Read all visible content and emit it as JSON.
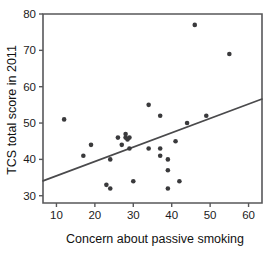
{
  "chart_data": {
    "type": "scatter",
    "title": "",
    "xlabel": "Concern about passive smoking",
    "ylabel": "TCS total score in 2011",
    "xlim": [
      6.5,
      63.5
    ],
    "ylim": [
      28.0,
      80.0
    ],
    "xticks": [
      10,
      20,
      30,
      40,
      50,
      60
    ],
    "yticks": [
      30,
      40,
      50,
      60,
      70,
      80
    ],
    "xtick_labels": [
      "10",
      "20",
      "30",
      "40",
      "50",
      "60"
    ],
    "ytick_labels": [
      "30",
      "40",
      "50",
      "60",
      "70",
      "80"
    ],
    "grid": false,
    "legend": false,
    "point_color": "#3a3a3c",
    "line_color": "#4a4a4c",
    "axis_color": "#58585a",
    "points": [
      {
        "x": 12,
        "y": 51
      },
      {
        "x": 17,
        "y": 41
      },
      {
        "x": 19,
        "y": 44
      },
      {
        "x": 23,
        "y": 33
      },
      {
        "x": 24,
        "y": 40
      },
      {
        "x": 24,
        "y": 32
      },
      {
        "x": 26,
        "y": 46
      },
      {
        "x": 27,
        "y": 44
      },
      {
        "x": 28,
        "y": 46
      },
      {
        "x": 28,
        "y": 47
      },
      {
        "x": 28.5,
        "y": 45.5
      },
      {
        "x": 29,
        "y": 46
      },
      {
        "x": 29,
        "y": 43
      },
      {
        "x": 30,
        "y": 34
      },
      {
        "x": 34,
        "y": 55
      },
      {
        "x": 34,
        "y": 43
      },
      {
        "x": 37,
        "y": 52
      },
      {
        "x": 37,
        "y": 43
      },
      {
        "x": 37,
        "y": 41
      },
      {
        "x": 39,
        "y": 40
      },
      {
        "x": 39,
        "y": 37
      },
      {
        "x": 39,
        "y": 32
      },
      {
        "x": 41,
        "y": 45
      },
      {
        "x": 42,
        "y": 34
      },
      {
        "x": 44,
        "y": 50
      },
      {
        "x": 46,
        "y": 77
      },
      {
        "x": 49,
        "y": 52
      },
      {
        "x": 55,
        "y": 69
      }
    ],
    "fit_line": {
      "name": "regression-line",
      "x_start": 6.5,
      "y_start": 34.1,
      "x_end": 63.5,
      "y_end": 56.6,
      "slope": 0.395,
      "intercept": 31.53
    }
  }
}
